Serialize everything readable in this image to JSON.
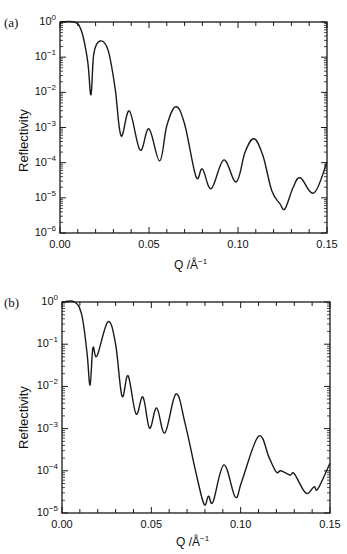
{
  "chart_data": [
    {
      "type": "line",
      "panel_label": "(a)",
      "title": "",
      "xlabel": "Q  /Å⁻¹",
      "ylabel": "Reflectivity",
      "yscale": "log",
      "xlim": [
        0.0,
        0.15
      ],
      "ylim": [
        1e-06,
        1
      ],
      "xticks": [
        "0.00",
        "0.05",
        "0.10",
        "0.15"
      ],
      "yticks": [
        "10^0",
        "10^-1",
        "10^-2",
        "10^-3",
        "10^-4",
        "10^-5",
        "10^-6"
      ],
      "grid": false,
      "legend": null,
      "series": [
        {
          "name": "reflectivity",
          "x": [
            0.0,
            0.008,
            0.012,
            0.0155,
            0.0174,
            0.019,
            0.0225,
            0.027,
            0.031,
            0.0343,
            0.039,
            0.045,
            0.05,
            0.056,
            0.06,
            0.065,
            0.07,
            0.0764,
            0.08,
            0.085,
            0.092,
            0.099,
            0.104,
            0.109,
            0.114,
            0.119,
            0.1236,
            0.1264,
            0.131,
            0.135,
            0.1427,
            0.15
          ],
          "log10y": [
            0.0,
            0.0,
            -0.25,
            -1.1,
            -2.07,
            -0.9,
            -0.54,
            -0.8,
            -1.9,
            -3.24,
            -2.53,
            -3.64,
            -3.04,
            -3.95,
            -2.95,
            -2.41,
            -2.9,
            -4.4,
            -4.18,
            -4.74,
            -3.92,
            -4.55,
            -3.7,
            -3.32,
            -3.8,
            -4.8,
            -5.17,
            -5.31,
            -4.7,
            -4.43,
            -4.86,
            -3.98
          ]
        }
      ]
    },
    {
      "type": "line",
      "panel_label": "(b)",
      "title": "",
      "xlabel": "Q  /Å⁻¹",
      "ylabel": "Reflectivity",
      "yscale": "log",
      "xlim": [
        0.0,
        0.15
      ],
      "ylim": [
        1e-05,
        1
      ],
      "xticks": [
        "0.00",
        "0.05",
        "0.10",
        "0.15"
      ],
      "yticks": [
        "10^0",
        "10^-1",
        "10^-2",
        "10^-3",
        "10^-4",
        "10^-5"
      ],
      "grid": false,
      "legend": null,
      "series": [
        {
          "name": "reflectivity",
          "x": [
            0.0,
            0.007,
            0.011,
            0.014,
            0.0157,
            0.0173,
            0.0196,
            0.0257,
            0.03,
            0.0336,
            0.037,
            0.0414,
            0.0453,
            0.049,
            0.053,
            0.0576,
            0.0638,
            0.069,
            0.075,
            0.0795,
            0.082,
            0.0845,
            0.0906,
            0.097,
            0.1007,
            0.11,
            0.116,
            0.12,
            0.1225,
            0.1276,
            0.13,
            0.1365,
            0.141,
            0.1432,
            0.15
          ],
          "log10y": [
            0.0,
            0.0,
            -0.3,
            -1.2,
            -1.97,
            -1.09,
            -1.28,
            -0.47,
            -1.0,
            -2.23,
            -1.75,
            -2.65,
            -2.25,
            -2.99,
            -2.51,
            -3.1,
            -2.18,
            -2.9,
            -4.05,
            -4.79,
            -4.6,
            -4.74,
            -3.86,
            -4.62,
            -4.24,
            -3.18,
            -3.7,
            -4.03,
            -4.0,
            -4.1,
            -4.07,
            -4.53,
            -4.38,
            -4.43,
            -3.82
          ]
        }
      ]
    }
  ],
  "panels": [
    {
      "label": "(a)",
      "ylabel": "Reflectivity",
      "xlabel_main": "Q  /Å",
      "xlabel_sup": "−1",
      "xticks": [
        "0.00",
        "0.05",
        "0.10",
        "0.15"
      ],
      "ytick_base": "10",
      "ytick_exps": [
        "0",
        "−1",
        "−2",
        "−3",
        "−4",
        "−5",
        "−6"
      ]
    },
    {
      "label": "(b)",
      "ylabel": "Reflectivity",
      "xlabel_main": "Q  /Å",
      "xlabel_sup": "−1",
      "xticks": [
        "0.00",
        "0.05",
        "0.10",
        "0.15"
      ],
      "ytick_base": "10",
      "ytick_exps": [
        "0",
        "−1",
        "−2",
        "−3",
        "−4",
        "−5"
      ]
    }
  ],
  "style": {
    "line_color": "#1a1a1a",
    "axis_color": "#1a1a1a",
    "background": "#ffffff"
  }
}
